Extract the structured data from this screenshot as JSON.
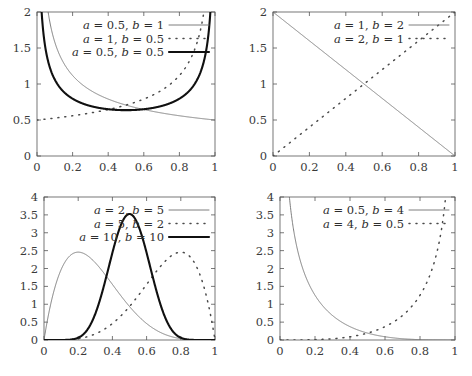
{
  "figure": {
    "kind": "beta-distribution-pdf-grid",
    "rows": 2,
    "cols": 2,
    "background": "#ffffff",
    "frame_color": "#555555",
    "text_color": "#333333"
  },
  "styles": {
    "thin_solid": {
      "color": "#6f6f6f",
      "width": 0.9,
      "dash": "none"
    },
    "dotted": {
      "color": "#4a4a4a",
      "width": 1.5,
      "dash": "1,6"
    },
    "thick_solid": {
      "color": "#101010",
      "width": 2.1,
      "dash": "none"
    }
  },
  "chart_data": [
    {
      "id": "panel-top-left",
      "type": "line",
      "title": "",
      "xlabel": "",
      "ylabel": "",
      "xlim": [
        0,
        1
      ],
      "ylim": [
        0,
        2
      ],
      "xticks": [
        0,
        0.2,
        0.4,
        0.6,
        0.8,
        1
      ],
      "xticklabels": [
        "0",
        "0.2",
        "0.4",
        "0.6",
        "0.8",
        "1"
      ],
      "yticks": [
        0,
        0.5,
        1,
        1.5,
        2
      ],
      "yticklabels": [
        "0",
        "0.5",
        "1",
        "1.5",
        "2"
      ],
      "grid": false,
      "legend_position": "top-center",
      "series": [
        {
          "name": "a = 0.5, b = 1",
          "a": 0.5,
          "b": 1,
          "style": "thin_solid"
        },
        {
          "name": "a = 1, b = 0.5",
          "a": 1,
          "b": 0.5,
          "style": "dotted"
        },
        {
          "name": "a = 0.5, b = 0.5",
          "a": 0.5,
          "b": 0.5,
          "style": "thick_solid"
        }
      ]
    },
    {
      "id": "panel-top-right",
      "type": "line",
      "title": "",
      "xlabel": "",
      "ylabel": "",
      "xlim": [
        0,
        1
      ],
      "ylim": [
        0,
        2
      ],
      "xticks": [
        0,
        0.2,
        0.4,
        0.6,
        0.8,
        1
      ],
      "xticklabels": [
        "0",
        "0.2",
        "0.4",
        "0.6",
        "0.8",
        "1"
      ],
      "yticks": [
        0,
        0.5,
        1,
        1.5,
        2
      ],
      "yticklabels": [
        "0",
        "0.5",
        "1",
        "1.5",
        "2"
      ],
      "grid": false,
      "legend_position": "top-center",
      "series": [
        {
          "name": "a = 1, b = 2",
          "a": 1,
          "b": 2,
          "style": "thin_solid"
        },
        {
          "name": "a = 2, b = 1",
          "a": 2,
          "b": 1,
          "style": "dotted"
        }
      ]
    },
    {
      "id": "panel-bottom-left",
      "type": "line",
      "title": "",
      "xlabel": "",
      "ylabel": "",
      "xlim": [
        0,
        1
      ],
      "ylim": [
        0,
        4
      ],
      "xticks": [
        0,
        0.2,
        0.4,
        0.6,
        0.8,
        1
      ],
      "xticklabels": [
        "0",
        "0.2",
        "0.4",
        "0.6",
        "0.8",
        "1"
      ],
      "yticks": [
        0,
        0.5,
        1,
        1.5,
        2,
        2.5,
        3,
        3.5,
        4
      ],
      "yticklabels": [
        "0",
        "0.5",
        "1",
        "1.5",
        "2",
        "2.5",
        "3",
        "3.5",
        "4"
      ],
      "grid": false,
      "legend_position": "top-center",
      "series": [
        {
          "name": "a = 2, b = 5",
          "a": 2,
          "b": 5,
          "style": "thin_solid"
        },
        {
          "name": "a = 5, b = 2",
          "a": 5,
          "b": 2,
          "style": "dotted"
        },
        {
          "name": "a = 10, b = 10",
          "a": 10,
          "b": 10,
          "style": "thick_solid"
        }
      ]
    },
    {
      "id": "panel-bottom-right",
      "type": "line",
      "title": "",
      "xlabel": "",
      "ylabel": "",
      "xlim": [
        0,
        1
      ],
      "ylim": [
        0,
        4
      ],
      "xticks": [
        0,
        0.2,
        0.4,
        0.6,
        0.8,
        1
      ],
      "xticklabels": [
        "0",
        "0.2",
        "0.4",
        "0.6",
        "0.8",
        "1"
      ],
      "yticks": [
        0,
        0.5,
        1,
        1.5,
        2,
        2.5,
        3,
        3.5,
        4
      ],
      "yticklabels": [
        "0",
        "0.5",
        "1",
        "1.5",
        "2",
        "2.5",
        "3",
        "3.5",
        "4"
      ],
      "grid": false,
      "legend_position": "top-center",
      "series": [
        {
          "name": "a = 0.5, b = 4",
          "a": 0.5,
          "b": 4,
          "style": "thin_solid"
        },
        {
          "name": "a = 4, b = 0.5",
          "a": 4,
          "b": 0.5,
          "style": "dotted"
        }
      ]
    }
  ]
}
